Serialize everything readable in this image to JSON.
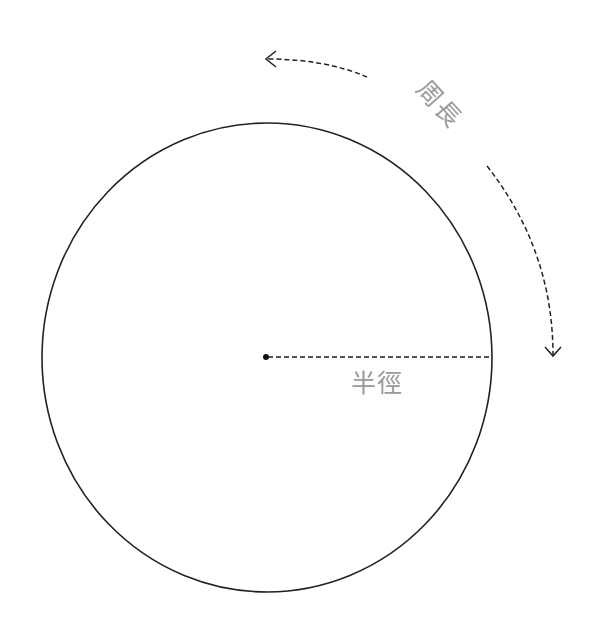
{
  "diagram": {
    "title": "",
    "labels": {
      "radius": "半徑",
      "circumference": "周長"
    },
    "circle": {
      "cx": 267,
      "cy": 357.5,
      "rx": 225,
      "ry": 234.5,
      "stroke": "#222222"
    },
    "center_point": {
      "x": 266,
      "y": 357
    },
    "radius_line": {
      "from": [
        266,
        357
      ],
      "to": [
        492,
        357
      ],
      "style": "dashed"
    },
    "arrows": [
      {
        "name": "circumference-arrow-top",
        "direction": "left",
        "style": "dashed"
      },
      {
        "name": "circumference-arrow-right",
        "direction": "down",
        "style": "dashed"
      }
    ],
    "colors": {
      "line": "#222222",
      "label": "#9a9a9a",
      "background": "#ffffff"
    }
  }
}
